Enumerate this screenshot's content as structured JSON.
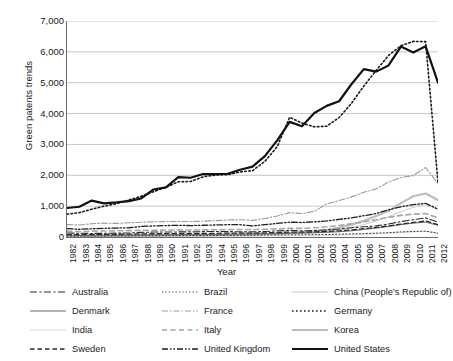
{
  "chart_data": {
    "type": "line",
    "title": "",
    "xlabel": "Year",
    "ylabel": "Green patents trends",
    "xlim": [
      1982,
      2012
    ],
    "ylim": [
      0,
      7000
    ],
    "grid": true,
    "legend_position": "bottom",
    "ytick_labels": [
      "7,000",
      "6,000",
      "5,000",
      "4,000",
      "3,000",
      "2,000",
      "1,000",
      "0"
    ],
    "ytick_values": [
      7000,
      6000,
      5000,
      4000,
      3000,
      2000,
      1000,
      0
    ],
    "categories": [
      "1982",
      "1983",
      "1984",
      "1985",
      "1986",
      "1987",
      "1988",
      "1989",
      "1990",
      "1991",
      "1992",
      "1993",
      "1994",
      "1995",
      "1996",
      "1997",
      "1998",
      "1999",
      "2000",
      "2001",
      "2002",
      "2003",
      "2004",
      "2005",
      "2006",
      "2007",
      "2008",
      "2009",
      "2010",
      "2011",
      "2012"
    ],
    "series": [
      {
        "name": "Australia",
        "style": "dash-dot",
        "color": "#2b2b2b",
        "width": 1.1,
        "dash": "7,2.5,2,2.5",
        "values": [
          130,
          120,
          115,
          120,
          125,
          130,
          150,
          160,
          160,
          165,
          165,
          175,
          180,
          175,
          170,
          165,
          180,
          200,
          215,
          200,
          210,
          230,
          260,
          300,
          330,
          360,
          420,
          500,
          560,
          620,
          480
        ]
      },
      {
        "name": "Brazil",
        "style": "dotted",
        "color": "#3a3a3a",
        "width": 1.0,
        "dash": "1.2,2.2",
        "values": [
          30,
          28,
          30,
          30,
          35,
          35,
          40,
          40,
          42,
          45,
          45,
          45,
          50,
          50,
          55,
          55,
          60,
          65,
          70,
          70,
          75,
          80,
          90,
          100,
          110,
          125,
          140,
          165,
          180,
          190,
          120
        ]
      },
      {
        "name": "China (People's Republic of)",
        "style": "solid-light",
        "color": "#c9c9c9",
        "width": 1.0,
        "dash": "",
        "values": [
          10,
          12,
          15,
          18,
          20,
          25,
          30,
          32,
          35,
          40,
          45,
          50,
          55,
          60,
          65,
          70,
          80,
          95,
          110,
          125,
          150,
          185,
          230,
          300,
          400,
          520,
          660,
          820,
          960,
          1080,
          900
        ]
      },
      {
        "name": "Denmark",
        "style": "solid-thin",
        "color": "#5a5a5a",
        "width": 0.9,
        "dash": "",
        "values": [
          60,
          55,
          58,
          60,
          62,
          65,
          70,
          72,
          75,
          78,
          80,
          82,
          85,
          88,
          90,
          95,
          100,
          110,
          120,
          125,
          135,
          150,
          170,
          200,
          240,
          290,
          340,
          400,
          450,
          480,
          380
        ]
      },
      {
        "name": "France",
        "style": "dash-dot-light",
        "color": "#9a9a9a",
        "width": 1.1,
        "dash": "6,2,1.5,2",
        "values": [
          400,
          390,
          430,
          450,
          440,
          460,
          480,
          490,
          500,
          505,
          500,
          510,
          530,
          550,
          560,
          540,
          600,
          680,
          790,
          760,
          830,
          1070,
          1180,
          1300,
          1450,
          1560,
          1780,
          1930,
          1990,
          2250,
          1740
        ]
      },
      {
        "name": "Germany",
        "style": "dotted",
        "color": "#1a1a1a",
        "width": 1.6,
        "dash": "1.6,2.4",
        "values": [
          740,
          790,
          900,
          1000,
          1080,
          1200,
          1320,
          1470,
          1610,
          1790,
          1800,
          1950,
          2010,
          2020,
          2110,
          2150,
          2450,
          2930,
          3880,
          3690,
          3570,
          3590,
          3870,
          4330,
          4890,
          5400,
          5880,
          6200,
          6340,
          6330,
          1760
        ]
      },
      {
        "name": "India",
        "style": "solid-faint",
        "color": "#dcdcdc",
        "width": 1.0,
        "dash": "",
        "values": [
          5,
          6,
          6,
          7,
          8,
          8,
          10,
          10,
          12,
          12,
          14,
          15,
          16,
          18,
          20,
          22,
          25,
          28,
          32,
          35,
          40,
          48,
          58,
          70,
          85,
          100,
          120,
          145,
          165,
          180,
          130
        ]
      },
      {
        "name": "Italy",
        "style": "dashed-light",
        "color": "#a8a8a8",
        "width": 1.6,
        "dash": "5,3.5",
        "values": [
          190,
          175,
          190,
          195,
          200,
          205,
          215,
          220,
          225,
          230,
          225,
          230,
          235,
          240,
          245,
          240,
          250,
          265,
          280,
          280,
          300,
          330,
          370,
          430,
          490,
          560,
          640,
          700,
          740,
          760,
          620
        ]
      },
      {
        "name": "Korea",
        "style": "solid-gray-thick",
        "color": "#bcbcbc",
        "width": 2.1,
        "dash": "",
        "values": [
          20,
          22,
          25,
          28,
          30,
          35,
          40,
          45,
          48,
          52,
          55,
          60,
          65,
          70,
          80,
          85,
          95,
          110,
          130,
          150,
          180,
          230,
          300,
          400,
          530,
          680,
          850,
          1100,
          1320,
          1410,
          1200
        ]
      },
      {
        "name": "Sweden",
        "style": "dashed",
        "color": "#2b2b2b",
        "width": 1.3,
        "dash": "4.5,3"
      },
      {
        "name": "United Kingdom",
        "style": "dash-dot-dot",
        "color": "#1f1f1f",
        "width": 1.3,
        "dash": "6,2,1.5,2,1.5,2",
        "values": [
          270,
          250,
          265,
          280,
          290,
          300,
          340,
          360,
          370,
          380,
          370,
          380,
          390,
          400,
          400,
          360,
          400,
          440,
          480,
          470,
          490,
          520,
          570,
          620,
          690,
          760,
          880,
          980,
          1050,
          1090,
          900
        ]
      },
      {
        "name": "United States",
        "style": "solid-black-thick",
        "color": "#111111",
        "width": 2.2,
        "dash": "",
        "values": [
          940,
          980,
          1180,
          1090,
          1120,
          1160,
          1250,
          1540,
          1610,
          1940,
          1920,
          2040,
          2040,
          2050,
          2180,
          2280,
          2620,
          3130,
          3730,
          3590,
          4020,
          4250,
          4400,
          4950,
          5440,
          5360,
          5560,
          6170,
          5980,
          6180,
          5000
        ]
      }
    ],
    "sweden_values": [
      80,
      75,
      80,
      85,
      88,
      92,
      100,
      105,
      108,
      112,
      110,
      115,
      120,
      125,
      130,
      125,
      135,
      145,
      160,
      155,
      165,
      180,
      200,
      230,
      270,
      310,
      360,
      420,
      470,
      520,
      400
    ]
  },
  "legend": {
    "items": [
      {
        "label": "Australia",
        "series": 0
      },
      {
        "label": "Brazil",
        "series": 1
      },
      {
        "label": "China (People's Republic of)",
        "series": 2
      },
      {
        "label": "Denmark",
        "series": 3
      },
      {
        "label": "France",
        "series": 4
      },
      {
        "label": "Germany",
        "series": 5
      },
      {
        "label": "India",
        "series": 6
      },
      {
        "label": "Italy",
        "series": 7
      },
      {
        "label": "Korea",
        "series": 8
      },
      {
        "label": "Sweden",
        "series": 9
      },
      {
        "label": "United Kingdom",
        "series": 10
      },
      {
        "label": "United States",
        "series": 11
      }
    ]
  },
  "colors": {
    "axis": "#6b6b6b",
    "grid": "#b8b8b8",
    "text": "#1a1a1a",
    "background": "#ffffff"
  }
}
